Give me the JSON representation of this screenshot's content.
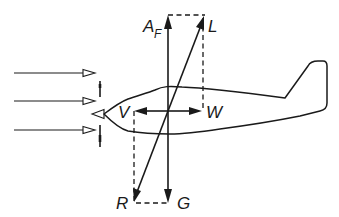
{
  "figure": {
    "labels": {
      "lift_total": "L",
      "thrust": "A",
      "thrust_subscript": "F",
      "resultant_drag": "R",
      "weight": "G",
      "drag": "W",
      "propulsion": "V"
    },
    "airflow_arrow_count": 3,
    "colors": {
      "line": "#1a1a1a",
      "background": "#ffffff"
    }
  }
}
